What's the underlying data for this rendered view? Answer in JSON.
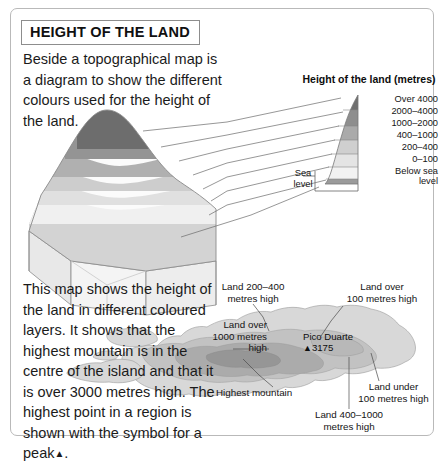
{
  "title": "HEIGHT OF THE LAND",
  "intro_paragraph": "Beside a topographical map is a diagram to show the different colours used for the height of the land.",
  "body_paragraph_before_symbol": "This map shows the height of the land in different coloured layers. It shows that the highest mountain is in the centre of the island and that it is over 3000 metres high. The highest point in a region is shown with the symbol for a peak",
  "body_paragraph_symbol": "▲",
  "body_paragraph_after_symbol": ".",
  "legend": {
    "heading": "Height of the land (metres)",
    "bands": [
      {
        "label": "Over 4000",
        "color": "#6f6f6f"
      },
      {
        "label": "2000–4000",
        "color": "#8e8e8e"
      },
      {
        "label": "1000–2000",
        "color": "#aaaaaa"
      },
      {
        "label": "400–1000",
        "color": "#cfcfcf"
      },
      {
        "label": "200–400",
        "color": "#e4e4e4"
      },
      {
        "label": "0–100",
        "color": "#f2f2f2"
      },
      {
        "label": "Below sea level",
        "label_line1": "Below sea",
        "label_line2": "level",
        "color": "#9b9b9b"
      }
    ],
    "sea_level_line1": "Sea",
    "sea_level_line2": "level"
  },
  "map": {
    "peak_name": "Pico Duarte",
    "peak_symbol": "▲",
    "peak_height": "3175",
    "annotations": [
      {
        "name": "land-200-400",
        "line1": "Land 200–400",
        "line2": "metres high"
      },
      {
        "name": "land-over-100",
        "line1": "Land over",
        "line2": "100 metres high"
      },
      {
        "name": "land-over-1000",
        "line1": "Land over",
        "line2": "1000 metres",
        "line3": "high"
      },
      {
        "name": "land-under-100",
        "line1": "Land under",
        "line2": "100 metres high"
      },
      {
        "name": "land-400-1000",
        "line1": "Land 400–1000",
        "line2": "metres high"
      },
      {
        "name": "highest-mountain",
        "line1": "Highest mountain"
      }
    ]
  },
  "colors": {
    "page_border": "#b9b9b9",
    "text": "#1b1b1b",
    "leader_line": "#6a6a6a"
  }
}
